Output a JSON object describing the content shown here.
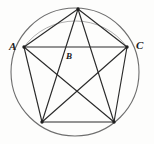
{
  "figure": {
    "kind": "geometry-diagram",
    "background_color": "#fdfdfc",
    "stroke_color": "#2b2b2b",
    "circle_stroke_color": "#6e6e6e",
    "label_color": "#1a1a1a",
    "canvas": {
      "width": 154,
      "height": 144
    },
    "circle": {
      "cx": 75,
      "cy": 72,
      "r": 64
    },
    "vertices": [
      {
        "id": "top",
        "x": 78,
        "y": 9
      },
      {
        "id": "left",
        "x": 24,
        "y": 47
      },
      {
        "id": "right",
        "x": 127,
        "y": 47
      },
      {
        "id": "bottom_left",
        "x": 42,
        "y": 122
      },
      {
        "id": "bottom_right",
        "x": 114,
        "y": 122
      }
    ],
    "edges": [
      {
        "from": "left",
        "to": "right"
      },
      {
        "from": "left",
        "to": "top"
      },
      {
        "from": "top",
        "to": "right"
      },
      {
        "from": "left",
        "to": "bottom_left"
      },
      {
        "from": "right",
        "to": "bottom_right"
      },
      {
        "from": "bottom_left",
        "to": "bottom_right"
      },
      {
        "from": "top",
        "to": "bottom_left"
      },
      {
        "from": "top",
        "to": "bottom_right"
      },
      {
        "from": "left",
        "to": "bottom_right"
      },
      {
        "from": "right",
        "to": "bottom_left"
      }
    ],
    "labels": [
      {
        "id": "label-a",
        "text": "A",
        "x": 9,
        "y": 41,
        "size": "normal"
      },
      {
        "id": "label-b",
        "text": "B",
        "x": 66,
        "y": 52,
        "size": "small"
      },
      {
        "id": "label-c",
        "text": "C",
        "x": 136,
        "y": 40,
        "size": "normal"
      }
    ]
  }
}
